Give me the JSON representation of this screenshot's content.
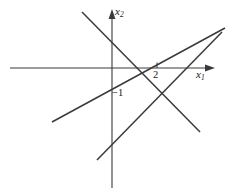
{
  "figure": {
    "width": 234,
    "height": 196,
    "background": "#ffffff",
    "stroke_color": "#3a3a3a",
    "text_color": "#1a1a1a"
  },
  "axes": {
    "x_axis": {
      "name": "x1",
      "label": "x",
      "subscript": "1",
      "start_x": 10,
      "end_x": 215,
      "y": 68,
      "arrow": "right"
    },
    "y_axis": {
      "name": "x2",
      "label": "x",
      "subscript": "2",
      "x": 112,
      "start_y": 188,
      "end_y": 10,
      "arrow": "up"
    },
    "origin": {
      "x": 112,
      "y": 68
    }
  },
  "ticks": [
    {
      "label": "2",
      "axis": "x",
      "pixel_x": 157,
      "value": 2
    }
  ],
  "annotations": [
    {
      "label": "−1",
      "pixel_x": 112,
      "pixel_y": 88,
      "value": -1
    }
  ],
  "chart_data": {
    "type": "line",
    "title": "",
    "xlabel": "x1",
    "ylabel": "x2",
    "grid": false,
    "legend": false,
    "xlim": [
      10,
      215
    ],
    "ylim": [
      188,
      10
    ],
    "series": [
      {
        "name": "line-descending",
        "points": [
          [
            82,
            12
          ],
          [
            200,
            132
          ]
        ],
        "direction": "descending",
        "color": "#3a3a3a"
      },
      {
        "name": "line-ascending-shallow",
        "points": [
          [
            52,
            122
          ],
          [
            225,
            28
          ]
        ],
        "direction": "ascending",
        "color": "#3a3a3a"
      },
      {
        "name": "line-ascending-steep",
        "points": [
          [
            97,
            160
          ],
          [
            222,
            32
          ]
        ],
        "direction": "ascending",
        "color": "#3a3a3a"
      }
    ]
  }
}
